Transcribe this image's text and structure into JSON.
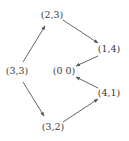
{
  "diagram": {
    "type": "directed-graph",
    "nodes": [
      {
        "id": "n33",
        "label": "(3,3)",
        "x": 17,
        "y": 71
      },
      {
        "id": "n23",
        "label": "(2,3)",
        "x": 52,
        "y": 15
      },
      {
        "id": "n14",
        "label": "(1,4)",
        "x": 109,
        "y": 49
      },
      {
        "id": "n00",
        "label": "(0 0)",
        "x": 64,
        "y": 71
      },
      {
        "id": "n41",
        "label": "(4,1)",
        "x": 109,
        "y": 93
      },
      {
        "id": "n32",
        "label": "(3,2)",
        "x": 53,
        "y": 127
      }
    ],
    "edges": [
      {
        "from": "(3,3)",
        "to": "(2,3)"
      },
      {
        "from": "(2,3)",
        "to": "(1,4)"
      },
      {
        "from": "(1,4)",
        "to": "(0 0)"
      },
      {
        "from": "(3,3)",
        "to": "(3,2)"
      },
      {
        "from": "(3,2)",
        "to": "(4,1)"
      },
      {
        "from": "(4,1)",
        "to": "(0 0)"
      }
    ],
    "colors": {
      "text": "#3a3a3a",
      "edge": "#555555",
      "background": "#ffffff"
    }
  }
}
